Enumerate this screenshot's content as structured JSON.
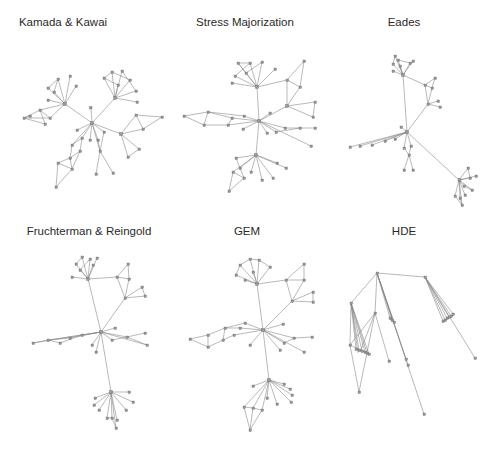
{
  "figure": {
    "panels": [
      {
        "id": "kk",
        "title": "Kamada & Kawai",
        "title_x": 63,
        "title_y": 16
      },
      {
        "id": "sm",
        "title": "Stress Majorization",
        "title_x": 245,
        "title_y": 16
      },
      {
        "id": "eades",
        "title": "Eades",
        "title_x": 404,
        "title_y": 16
      },
      {
        "id": "fr",
        "title": "Fruchterman & Reingold",
        "title_x": 89,
        "title_y": 225
      },
      {
        "id": "gem",
        "title": "GEM",
        "title_x": 247,
        "title_y": 225
      },
      {
        "id": "hde",
        "title": "HDE",
        "title_x": 404,
        "title_y": 225
      }
    ]
  },
  "colors": {
    "edge": "#8a8a8a",
    "node": "#9a9a9a",
    "title": "#2a2a2a",
    "background": "#ffffff"
  }
}
